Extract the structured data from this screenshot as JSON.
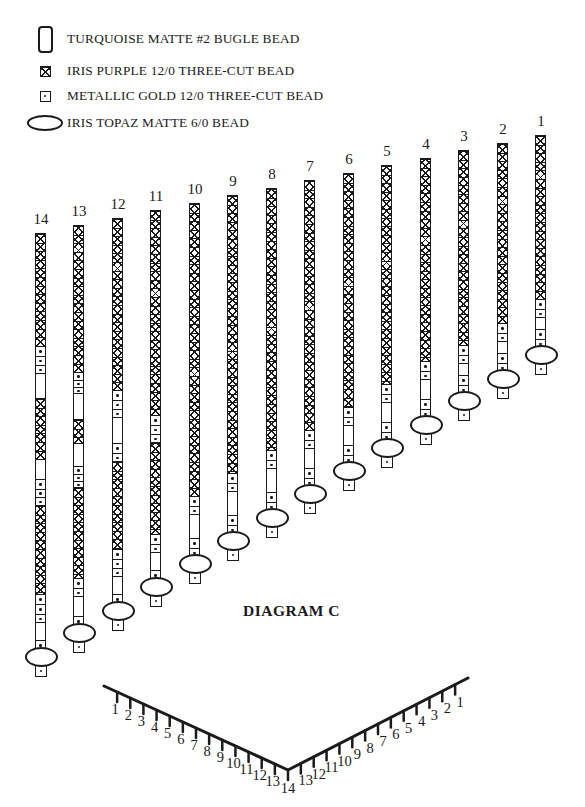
{
  "legend": {
    "items": [
      {
        "icon": "bugle-bead-icon",
        "label": "TURQUOISE MATTE #2 BUGLE BEAD"
      },
      {
        "icon": "purple-three-cut-bead-icon",
        "label": "IRIS PURPLE 12/0 THREE-CUT BEAD"
      },
      {
        "icon": "gold-three-cut-bead-icon",
        "label": "METALLIC GOLD 12/0 THREE-CUT BEAD"
      },
      {
        "icon": "topaz-bead-icon",
        "label": "IRIS TOPAZ MATTE 6/0 BEAD"
      }
    ]
  },
  "diagram": {
    "caption": "DIAGRAM C",
    "bead_types": {
      "p": "iris-purple-three-cut",
      "g": "metallic-gold-three-cut",
      "b": "turquoise-bugle"
    },
    "strands": [
      {
        "number": "1",
        "x": 541,
        "top": 135,
        "segments": [
          [
            "p",
            164
          ],
          [
            "g",
            18,
            2
          ],
          [
            "b",
            12
          ],
          [
            "g",
            18,
            2
          ]
        ]
      },
      {
        "number": "2",
        "x": 503,
        "top": 143,
        "segments": [
          [
            "p",
            180
          ],
          [
            "g",
            18,
            2
          ],
          [
            "b",
            12
          ],
          [
            "g",
            18,
            2
          ]
        ]
      },
      {
        "number": "3",
        "x": 464,
        "top": 150,
        "segments": [
          [
            "p",
            195
          ],
          [
            "g",
            18,
            2
          ],
          [
            "b",
            12
          ],
          [
            "g",
            18,
            2
          ]
        ]
      },
      {
        "number": "4",
        "x": 426,
        "top": 158,
        "segments": [
          [
            "p",
            203
          ],
          [
            "g",
            18,
            2
          ],
          [
            "b",
            20
          ],
          [
            "g",
            18,
            2
          ]
        ]
      },
      {
        "number": "5",
        "x": 387,
        "top": 165,
        "segments": [
          [
            "p",
            219
          ],
          [
            "g",
            18,
            2
          ],
          [
            "b",
            20
          ],
          [
            "g",
            18,
            2
          ]
        ]
      },
      {
        "number": "6",
        "x": 349,
        "top": 173,
        "segments": [
          [
            "p",
            234
          ],
          [
            "g",
            18,
            2
          ],
          [
            "b",
            20
          ],
          [
            "g",
            18,
            2
          ]
        ]
      },
      {
        "number": "7",
        "x": 310,
        "top": 180,
        "segments": [
          [
            "p",
            250
          ],
          [
            "g",
            18,
            2
          ],
          [
            "b",
            20
          ],
          [
            "g",
            18,
            2
          ]
        ]
      },
      {
        "number": "8",
        "x": 272,
        "top": 188,
        "segments": [
          [
            "p",
            262
          ],
          [
            "g",
            18,
            2
          ],
          [
            "b",
            24
          ],
          [
            "g",
            18,
            2
          ]
        ]
      },
      {
        "number": "9",
        "x": 233,
        "top": 195,
        "segments": [
          [
            "p",
            278
          ],
          [
            "g",
            18,
            2
          ],
          [
            "b",
            24
          ],
          [
            "g",
            18,
            2
          ]
        ]
      },
      {
        "number": "10",
        "x": 195,
        "top": 203,
        "segments": [
          [
            "p",
            293
          ],
          [
            "g",
            18,
            2
          ],
          [
            "b",
            24
          ],
          [
            "g",
            18,
            2
          ]
        ]
      },
      {
        "number": "11",
        "x": 156,
        "top": 210,
        "segments": [
          [
            "p",
            205
          ],
          [
            "g",
            27,
            3
          ],
          [
            "p",
            92
          ],
          [
            "g",
            18,
            2
          ],
          [
            "b",
            18
          ],
          [
            "g",
            9,
            1
          ]
        ]
      },
      {
        "number": "12",
        "x": 118,
        "top": 218,
        "segments": [
          [
            "p",
            172
          ],
          [
            "g",
            27,
            3
          ],
          [
            "b",
            26
          ],
          [
            "g",
            18,
            2
          ],
          [
            "p",
            88
          ],
          [
            "g",
            27,
            3
          ],
          [
            "b",
            18
          ],
          [
            "g",
            9,
            1
          ]
        ]
      },
      {
        "number": "13",
        "x": 79,
        "top": 225,
        "segments": [
          [
            "p",
            147
          ],
          [
            "g",
            21,
            3
          ],
          [
            "b",
            26
          ],
          [
            "p",
            24
          ],
          [
            "b",
            23
          ],
          [
            "g",
            21,
            3
          ],
          [
            "p",
            91
          ],
          [
            "g",
            18,
            2
          ],
          [
            "b",
            20
          ],
          [
            "g",
            9,
            1
          ]
        ]
      },
      {
        "number": "14",
        "x": 41,
        "top": 233,
        "segments": [
          [
            "p",
            113
          ],
          [
            "g",
            27,
            3
          ],
          [
            "b",
            25
          ],
          [
            "p",
            61
          ],
          [
            "b",
            20
          ],
          [
            "g",
            26,
            3
          ],
          [
            "p",
            89
          ],
          [
            "g",
            28,
            3
          ],
          [
            "b",
            18
          ],
          [
            "g",
            9,
            1
          ]
        ]
      }
    ]
  },
  "ruler": {
    "left_arm": {
      "start": [
        104,
        686
      ],
      "end": [
        288,
        770
      ]
    },
    "right_arm": {
      "start": [
        288,
        770
      ],
      "end": [
        468,
        678
      ]
    },
    "tick_length": 10,
    "left_labels": [
      "1",
      "2",
      "3",
      "4",
      "5",
      "6",
      "7",
      "8",
      "9",
      "10",
      "11",
      "12",
      "13"
    ],
    "vertex_label": "14",
    "right_labels": [
      "13",
      "12",
      "11",
      "10",
      "9",
      "8",
      "7",
      "6",
      "5",
      "4",
      "3",
      "2",
      "1"
    ]
  },
  "colors": {
    "ink": "#1a1a1a",
    "paper": "#ffffff"
  }
}
